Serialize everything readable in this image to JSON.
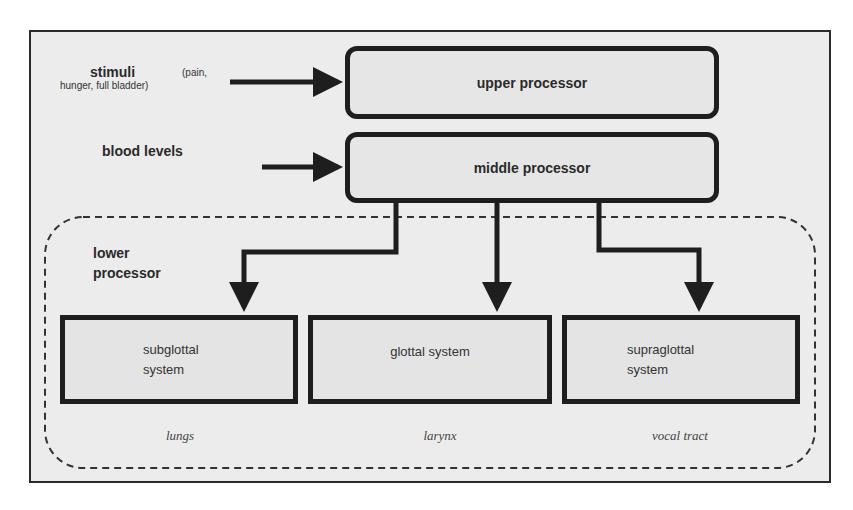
{
  "diagram": {
    "inputs": {
      "stimuli": {
        "label": "stimuli",
        "detail_line1": "(pain,",
        "detail_line2": "hunger,  full bladder)"
      },
      "blood_levels": {
        "label": "blood levels"
      }
    },
    "processors": {
      "upper": "upper processor",
      "middle": "middle processor",
      "lower": {
        "line1": "lower",
        "line2": "processor"
      }
    },
    "systems": [
      {
        "line1": "subglottal",
        "line2": "system",
        "organ": "lungs"
      },
      {
        "line1": "glottal system",
        "line2": "",
        "organ": "larynx"
      },
      {
        "line1": "supraglottal",
        "line2": "system",
        "organ": "vocal tract"
      }
    ],
    "colors": {
      "stroke": "#1e1e1e",
      "fill": "#e6e6e6",
      "background": "#ececec"
    }
  }
}
